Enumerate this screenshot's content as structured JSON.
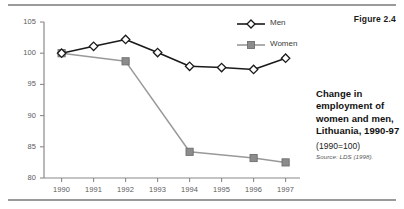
{
  "figure_number": "Figure 2.4",
  "caption": {
    "title": "Change in employment of women and men, Lithuania, 1990-97",
    "basis": "(1990=100)",
    "source": "Source: LDS (1998)."
  },
  "legend": {
    "men_label": "Men",
    "women_label": "Women",
    "position": "top-right"
  },
  "colors": {
    "men_line": "#1a1a1a",
    "men_marker_fill": "#ffffff",
    "women_line": "#999999",
    "women_marker_fill": "#8c8c8c",
    "axis": "#8a8a8a",
    "text": "#5b5b5b",
    "rule": "#9a9a9a"
  },
  "chart_data": {
    "type": "line",
    "title": "Change in employment of women and men, Lithuania, 1990-97",
    "subtitle": "(1990=100)",
    "xlabel": "",
    "ylabel": "",
    "xlim": [
      1990,
      1997
    ],
    "ylim": [
      80,
      105
    ],
    "yticks": [
      80,
      85,
      90,
      95,
      100,
      105
    ],
    "grid": false,
    "legend_position": "top-right",
    "categories": [
      "1990",
      "1991",
      "1992",
      "1993",
      "1994",
      "1995",
      "1996",
      "1997"
    ],
    "x": [
      1990,
      1991,
      1992,
      1993,
      1994,
      1995,
      1996,
      1997
    ],
    "series": [
      {
        "name": "Men",
        "marker": "diamond",
        "values": [
          100.0,
          101.1,
          102.2,
          100.1,
          97.9,
          97.7,
          97.4,
          99.2
        ]
      },
      {
        "name": "Women",
        "marker": "square",
        "values": [
          100.0,
          null,
          98.7,
          null,
          84.2,
          null,
          83.2,
          82.5
        ]
      }
    ],
    "annotations": [
      "Figure 2.4",
      "Source: LDS (1998)."
    ]
  }
}
